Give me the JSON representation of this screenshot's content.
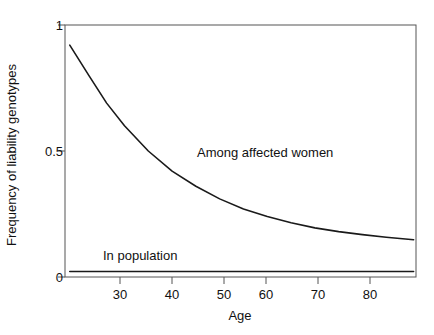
{
  "chart_data": {
    "type": "line",
    "title": "",
    "xlabel": "Age",
    "ylabel": "Frequency of liability genotypes",
    "xlim": [
      26,
      85
    ],
    "ylim": [
      0,
      1
    ],
    "xticks": [
      30,
      40,
      50,
      60,
      70,
      80
    ],
    "yticks": [
      "0",
      "0.5",
      "1"
    ],
    "ytick_values": [
      0,
      0.5,
      1
    ],
    "grid": false,
    "legend": "inline-annotations",
    "axis_color": "#444444",
    "line_color": "#1a1a1a",
    "series": [
      {
        "name": "Among affected women",
        "label_x": 52,
        "label_y": 0.53,
        "x": [
          26.8,
          30,
          33,
          36,
          40,
          44,
          48,
          52,
          56,
          60,
          64,
          68,
          72,
          76,
          80,
          84.6
        ],
        "values": [
          0.92,
          0.8,
          0.69,
          0.6,
          0.5,
          0.42,
          0.36,
          0.31,
          0.27,
          0.24,
          0.215,
          0.195,
          0.18,
          0.168,
          0.158,
          0.148
        ]
      },
      {
        "name": "In population",
        "label_x": 34,
        "label_y": 0.115,
        "x": [
          26.8,
          84.6
        ],
        "values": [
          0.022,
          0.022
        ]
      }
    ]
  },
  "axis": {
    "x_tick_labels": [
      "30",
      "40",
      "50",
      "60",
      "70",
      "80"
    ],
    "y_tick_labels": [
      "0",
      "0.5",
      "1"
    ],
    "x_title": "Age",
    "y_title": "Frequency of liability genotypes"
  },
  "annotations": {
    "affected": "Among affected women",
    "population": "In population"
  }
}
